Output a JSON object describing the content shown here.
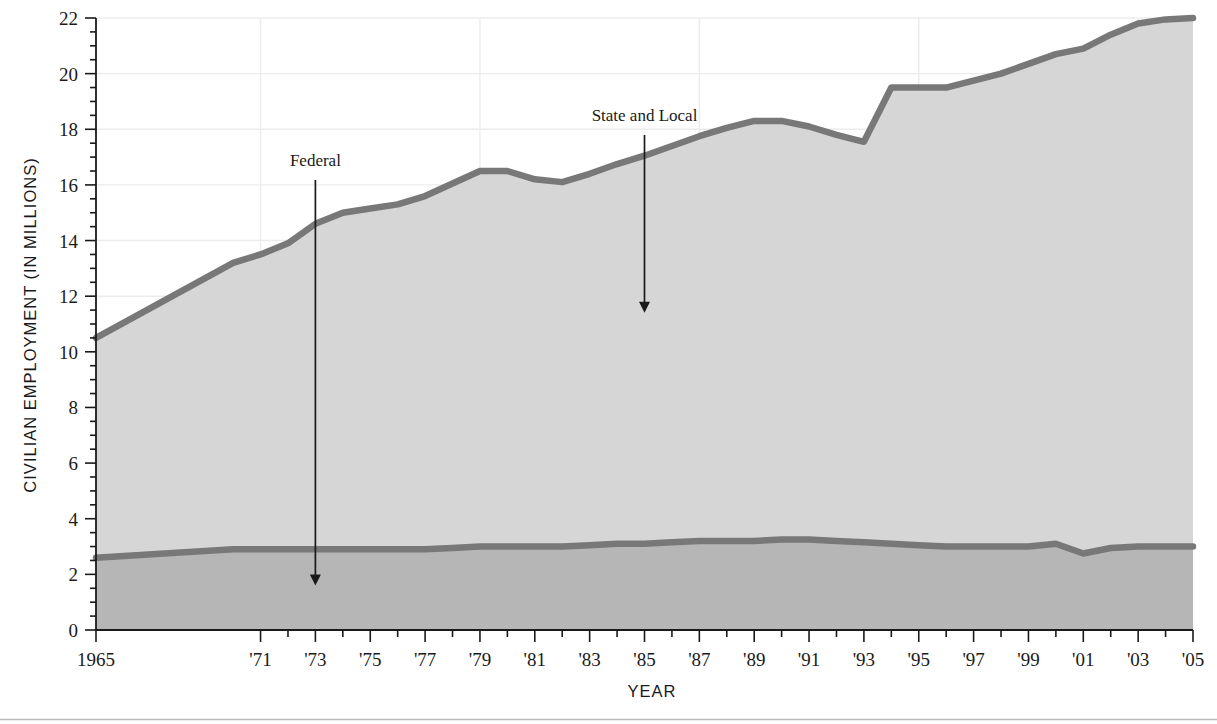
{
  "figure": {
    "bottom_rule": true,
    "colors": {
      "band_state_local": "#d6d6d6",
      "band_federal": "#b6b6b6",
      "line": "#787878",
      "grid": "#ececec",
      "axis": "#1a1a1a",
      "background": "#ffffff"
    }
  },
  "axes": {
    "y_title": "CIVILIAN EMPLOYMENT (IN MILLIONS)",
    "x_title": "YEAR",
    "y_ticks": [
      "0",
      "2",
      "4",
      "6",
      "8",
      "10",
      "12",
      "14",
      "16",
      "18",
      "20",
      "22"
    ],
    "x_ticks": [
      "1965",
      "'71",
      "'73",
      "'75",
      "'77",
      "'79",
      "'81",
      "'83",
      "'85",
      "'87",
      "'89",
      "'91",
      "'93",
      "'95",
      "'97",
      "'99",
      "'01",
      "'03",
      "'05"
    ]
  },
  "annotations": [
    {
      "label": "Federal",
      "x_year": 1973,
      "y_value": 1.6
    },
    {
      "label": "State and Local",
      "x_year": 1985,
      "y_value": 11.4
    }
  ],
  "chart_data": {
    "type": "area",
    "title": "",
    "subtitle": "",
    "xlabel": "YEAR",
    "ylabel": "CIVILIAN EMPLOYMENT (IN MILLIONS)",
    "xlim": [
      1965,
      2005
    ],
    "ylim": [
      0,
      22
    ],
    "grid": true,
    "legend_position": "inline-annotations",
    "stacked": true,
    "x": [
      1965,
      1970,
      1971,
      1972,
      1973,
      1974,
      1975,
      1976,
      1977,
      1978,
      1979,
      1980,
      1981,
      1982,
      1983,
      1984,
      1985,
      1986,
      1987,
      1988,
      1989,
      1990,
      1991,
      1992,
      1993,
      1994,
      1995,
      1996,
      1997,
      1998,
      1999,
      2000,
      2001,
      2002,
      2003,
      2004,
      2005
    ],
    "series": [
      {
        "name": "Federal",
        "values": [
          2.6,
          2.9,
          2.9,
          2.9,
          2.9,
          2.9,
          2.9,
          2.9,
          2.9,
          2.95,
          3.0,
          3.0,
          3.0,
          3.0,
          3.05,
          3.1,
          3.1,
          3.15,
          3.2,
          3.2,
          3.2,
          3.25,
          3.25,
          3.2,
          3.15,
          3.1,
          3.05,
          3.0,
          3.0,
          3.0,
          3.0,
          3.1,
          2.75,
          2.95,
          3.0,
          3.0,
          3.0
        ]
      },
      {
        "name": "State and Local",
        "values": [
          7.9,
          10.3,
          10.6,
          11.0,
          11.7,
          12.1,
          12.25,
          12.4,
          12.7,
          13.1,
          13.5,
          13.5,
          13.2,
          13.1,
          13.35,
          13.65,
          13.95,
          14.25,
          14.55,
          14.85,
          15.1,
          15.05,
          14.85,
          14.6,
          14.4,
          16.4,
          16.45,
          16.5,
          16.75,
          17.0,
          17.35,
          17.6,
          18.15,
          18.45,
          18.8,
          18.95,
          19.0
        ]
      }
    ],
    "cumulative_total": [
      10.5,
      13.2,
      13.5,
      13.9,
      14.6,
      15.0,
      15.15,
      15.3,
      15.6,
      16.05,
      16.5,
      16.5,
      16.2,
      16.1,
      16.4,
      16.75,
      17.05,
      17.4,
      17.75,
      18.05,
      18.3,
      18.3,
      18.1,
      17.8,
      17.55,
      19.5,
      19.5,
      19.5,
      19.75,
      20.0,
      20.35,
      20.7,
      20.9,
      21.4,
      21.8,
      21.95,
      22.0
    ]
  }
}
